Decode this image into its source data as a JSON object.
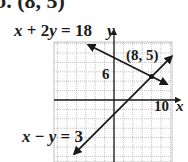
{
  "header": {
    "problem_label": "b. (8, 5)"
  },
  "chart_data": {
    "type": "line",
    "title": "",
    "xlabel": "x",
    "ylabel": "y",
    "grid": true,
    "grid_step": 2,
    "xlim": [
      -12,
      12
    ],
    "ylim": [
      -13,
      12
    ],
    "tick_labels": {
      "x": [
        "10"
      ],
      "y": [
        "6"
      ]
    },
    "series": [
      {
        "name": "x + 2y = 18",
        "equation": "x + 2y = 18",
        "x": [
          -5.5,
          11.3
        ],
        "y": [
          11.75,
          3.35
        ],
        "arrows": "both"
      },
      {
        "name": "x − y = 3",
        "equation": "x − y = 3",
        "x": [
          -8.5,
          12.3
        ],
        "y": [
          -11.5,
          9.3
        ],
        "arrows": "both"
      }
    ],
    "annotations": [
      {
        "text": "(8, 5)",
        "x": 8,
        "y": 5,
        "type": "intersection-point"
      }
    ],
    "solution": {
      "x": 8,
      "y": 5
    }
  },
  "labels": {
    "eq1_x": "x",
    "eq1_rest": " + 2",
    "eq1_y": "y",
    "eq1_end": " = 18",
    "eq2_x": "x",
    "eq2_mid": " − ",
    "eq2_y": "y",
    "eq2_end": " = 3",
    "point": "(8, 5)",
    "y_tick": "6",
    "x_tick": "10",
    "x_axis": "x",
    "y_axis": "y"
  },
  "colors": {
    "line": "#1a1a1a",
    "grid": "#9a9a9a",
    "axis": "#1a1a1a",
    "background": "#ffffff"
  }
}
